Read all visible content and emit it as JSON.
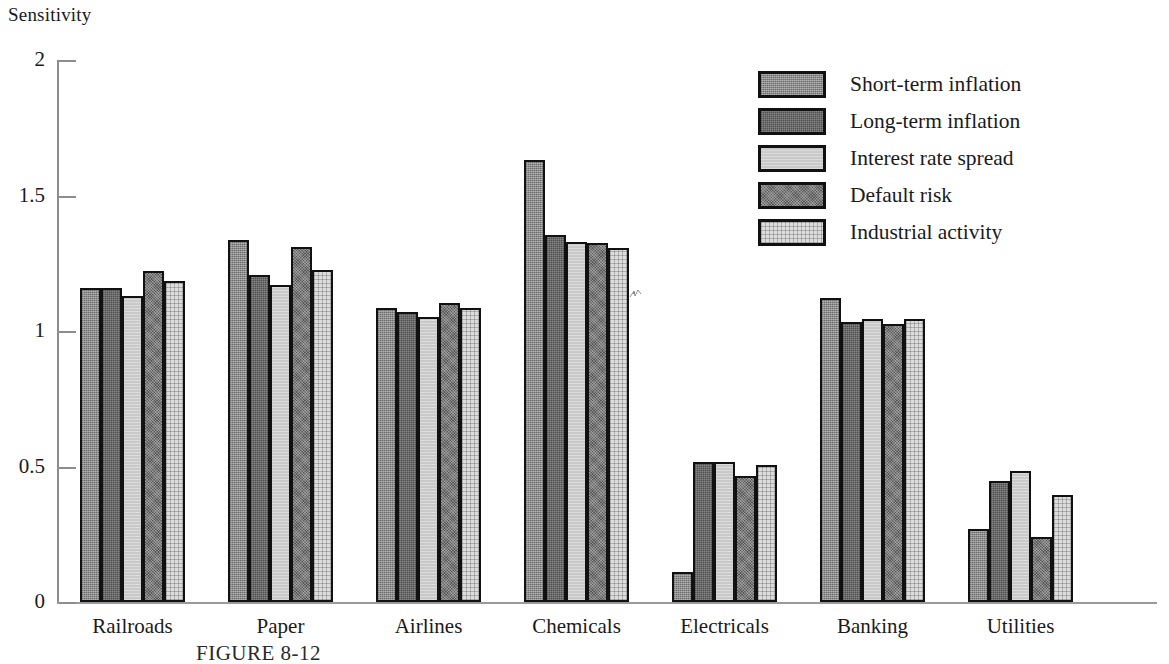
{
  "chart_data": {
    "type": "bar",
    "title": "",
    "xlabel": "",
    "ylabel": "Sensitivity",
    "ylim": [
      0,
      2
    ],
    "yticks": [
      0,
      0.5,
      1,
      1.5,
      2
    ],
    "ytick_labels": [
      "0",
      "0.5",
      "1",
      "1.5",
      "2"
    ],
    "grid": false,
    "legend_position": "top-right",
    "categories": [
      "Railroads",
      "Paper",
      "Airlines",
      "Chemicals",
      "Electricals",
      "Banking",
      "Utilities"
    ],
    "series": [
      {
        "name": "Short-term inflation",
        "color": "#8c8c8c",
        "values": [
          1.16,
          1.335,
          1.085,
          1.63,
          0.11,
          1.12,
          0.27
        ]
      },
      {
        "name": "Long-term inflation",
        "color": "#6b6b6b",
        "values": [
          1.16,
          1.205,
          1.07,
          1.355,
          0.515,
          1.035,
          0.445
        ]
      },
      {
        "name": "Interest rate spread",
        "color": "#c9c9c9",
        "values": [
          1.13,
          1.17,
          1.05,
          1.33,
          0.515,
          1.045,
          0.485
        ]
      },
      {
        "name": "Default risk",
        "color": "#7a7a7a",
        "values": [
          1.22,
          1.31,
          1.105,
          1.325,
          0.465,
          1.025,
          0.24
        ]
      },
      {
        "name": "Industrial activity",
        "color": "#dcdcdc",
        "values": [
          1.185,
          1.225,
          1.085,
          1.305,
          0.505,
          1.045,
          0.395
        ]
      }
    ]
  },
  "axis": {
    "y_title": "Sensitivity"
  },
  "caption": {
    "text": "FIGURE 8-12"
  }
}
